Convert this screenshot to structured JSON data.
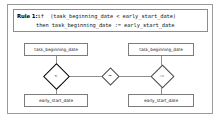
{
  "diagram": {
    "type": "rule-graph",
    "rule": {
      "label": "Rule 1:",
      "line1": "if  (task_beginning_date < early_start_date)",
      "line2": "then task_beginning_date := early_start_date"
    },
    "nodes": [
      {
        "id": "tbd-left",
        "label": "task_beginning_date",
        "shape": "rectangle",
        "position": "top-left"
      },
      {
        "id": "tbd-right",
        "label": "task_beginning_date",
        "shape": "rectangle",
        "position": "top-right"
      },
      {
        "id": "esd-left",
        "label": "early_start_date",
        "shape": "rectangle",
        "position": "bottom-left"
      },
      {
        "id": "esd-right",
        "label": "early_start_date",
        "shape": "rectangle",
        "position": "bottom-right"
      }
    ],
    "operators": [
      {
        "id": "less-than",
        "symbol": "<",
        "shape": "diamond",
        "emphasis": "bold"
      },
      {
        "id": "implies",
        "symbol": "→",
        "shape": "diamond",
        "emphasis": "normal"
      },
      {
        "id": "assign",
        "symbol": ":=",
        "shape": "diamond",
        "emphasis": "normal"
      }
    ],
    "colors": {
      "frame": "#9a9a9a",
      "node_border": "#7c7c7c",
      "edge": "#8f8f8f",
      "bold_operator": "#000000",
      "text": "#222222",
      "background": "#ffffff"
    }
  }
}
